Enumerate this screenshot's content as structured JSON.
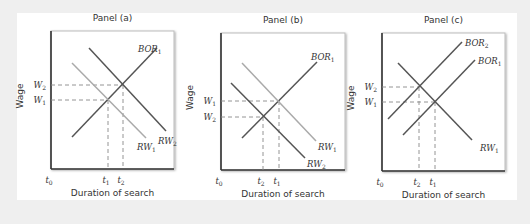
{
  "chart_data": [
    {
      "type": "line",
      "title": "Panel (a)",
      "xlabel": "Duration of search",
      "ylabel": "Wage",
      "box": [
        51,
        31,
        174,
        169
      ],
      "x_ticks": [
        {
          "label": "t",
          "sub": "0",
          "x": 51
        },
        {
          "label": "t",
          "sub": "1",
          "x": 108
        },
        {
          "label": "t",
          "sub": "2",
          "x": 123
        }
      ],
      "y_ticks": [
        {
          "label": "W",
          "sub": "2",
          "y": 85
        },
        {
          "label": "W",
          "sub": "1",
          "y": 100
        }
      ],
      "series": [
        {
          "name": "BOR1",
          "label": "BOR",
          "sub": "1",
          "color": "#555555",
          "points": [
            [
              72,
              137
            ],
            [
              157,
              48
            ]
          ],
          "label_pos": [
            138,
            52
          ]
        },
        {
          "name": "RW1",
          "label": "RW",
          "sub": "1",
          "color": "#aaaaaa",
          "points": [
            [
              72,
              63
            ],
            [
              146,
              138
            ]
          ],
          "label_pos": [
            137,
            150
          ]
        },
        {
          "name": "RW2",
          "label": "RW",
          "sub": "2",
          "color": "#555555",
          "points": [
            [
              89,
              48
            ],
            [
              166,
              131
            ]
          ],
          "label_pos": [
            158,
            144
          ]
        }
      ],
      "guides": [
        {
          "from": [
            51,
            85
          ],
          "to": [
            123,
            85
          ]
        },
        {
          "from": [
            51,
            100
          ],
          "to": [
            108,
            100
          ]
        },
        {
          "from": [
            108,
            100
          ],
          "to": [
            108,
            169
          ]
        },
        {
          "from": [
            123,
            85
          ],
          "to": [
            123,
            169
          ]
        }
      ]
    },
    {
      "type": "line",
      "title": "Panel (b)",
      "xlabel": "Duration of search",
      "ylabel": "Wage",
      "box": [
        221,
        33,
        345,
        170
      ],
      "x_ticks": [
        {
          "label": "t",
          "sub": "0",
          "x": 221
        },
        {
          "label": "t",
          "sub": "2",
          "x": 263
        },
        {
          "label": "t",
          "sub": "1",
          "x": 279
        }
      ],
      "y_ticks": [
        {
          "label": "W",
          "sub": "1",
          "y": 101
        },
        {
          "label": "W",
          "sub": "2",
          "y": 117
        }
      ],
      "series": [
        {
          "name": "BOR1",
          "label": "BOR",
          "sub": "1",
          "color": "#555555",
          "points": [
            [
              242,
              138
            ],
            [
              317,
              62
            ]
          ],
          "label_pos": [
            311,
            60
          ]
        },
        {
          "name": "RW1",
          "label": "RW",
          "sub": "1",
          "color": "#aaaaaa",
          "points": [
            [
              242,
              63
            ],
            [
              316,
              141
            ]
          ],
          "label_pos": [
            318,
            150
          ]
        },
        {
          "name": "RW2",
          "label": "RW",
          "sub": "2",
          "color": "#555555",
          "points": [
            [
              231,
              83
            ],
            [
              305,
              158
            ]
          ],
          "label_pos": [
            307,
            167
          ]
        }
      ],
      "guides": [
        {
          "from": [
            221,
            101
          ],
          "to": [
            279,
            101
          ]
        },
        {
          "from": [
            221,
            117
          ],
          "to": [
            263,
            117
          ]
        },
        {
          "from": [
            263,
            117
          ],
          "to": [
            263,
            170
          ]
        },
        {
          "from": [
            279,
            101
          ],
          "to": [
            279,
            170
          ]
        }
      ]
    },
    {
      "type": "line",
      "title": "Panel (c)",
      "xlabel": "Duration of search",
      "ylabel": "Wage",
      "box": [
        382,
        33,
        505,
        171
      ],
      "x_ticks": [
        {
          "label": "t",
          "sub": "0",
          "x": 382
        },
        {
          "label": "t",
          "sub": "2",
          "x": 419
        },
        {
          "label": "t",
          "sub": "1",
          "x": 435
        }
      ],
      "y_ticks": [
        {
          "label": "W",
          "sub": "2",
          "y": 87
        },
        {
          "label": "W",
          "sub": "1",
          "y": 102
        }
      ],
      "series": [
        {
          "name": "BOR2",
          "label": "BOR",
          "sub": "2",
          "color": "#555555",
          "points": [
            [
              388,
              119
            ],
            [
              462,
              42
            ]
          ],
          "label_pos": [
            465,
            46
          ]
        },
        {
          "name": "BOR1",
          "label": "BOR",
          "sub": "1",
          "color": "#555555",
          "points": [
            [
              403,
              135
            ],
            [
              475,
              60
            ]
          ],
          "label_pos": [
            478,
            64
          ]
        },
        {
          "name": "RW1",
          "label": "RW",
          "sub": "1",
          "color": "#555555",
          "points": [
            [
              398,
              63
            ],
            [
              472,
              140
            ]
          ],
          "label_pos": [
            480,
            151
          ]
        }
      ],
      "guides": [
        {
          "from": [
            382,
            87
          ],
          "to": [
            419,
            87
          ]
        },
        {
          "from": [
            382,
            102
          ],
          "to": [
            435,
            102
          ]
        },
        {
          "from": [
            419,
            87
          ],
          "to": [
            419,
            171
          ]
        },
        {
          "from": [
            435,
            102
          ],
          "to": [
            435,
            171
          ]
        }
      ]
    }
  ],
  "colors": {
    "background": "#efefef",
    "card": "#ffffff",
    "axis": "#333333",
    "guide": "#888888"
  }
}
